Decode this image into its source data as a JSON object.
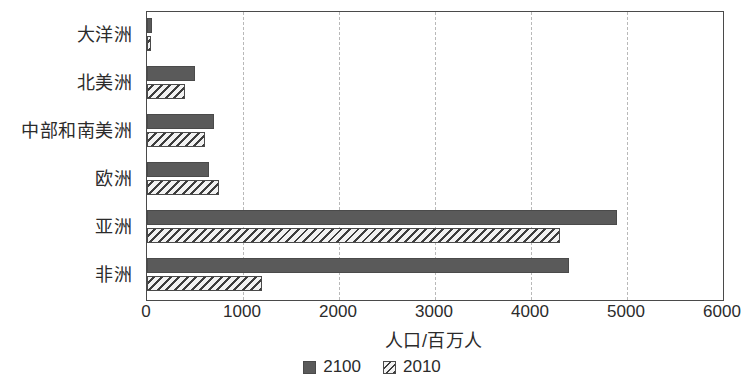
{
  "chart_data": {
    "type": "bar",
    "orientation": "horizontal",
    "title": "",
    "xlabel": "人口/百万人",
    "ylabel": "",
    "xlim": [
      0,
      6000
    ],
    "xticks": [
      0,
      1000,
      2000,
      3000,
      4000,
      5000,
      6000
    ],
    "xtick_labels": [
      "0",
      "1000",
      "2000",
      "3000",
      "4000",
      "5000",
      "6000"
    ],
    "grid": true,
    "grid_axis": "x",
    "grid_style": "dashed",
    "legend_position": "bottom-center",
    "categories": [
      "大洋洲",
      "北美洲",
      "中部和南美洲",
      "欧洲",
      "亚洲",
      "非洲"
    ],
    "series": [
      {
        "name": "2100",
        "fill": "solid",
        "color": "#5a5a5a",
        "values": [
          50,
          500,
          700,
          650,
          4900,
          4400
        ]
      },
      {
        "name": "2010",
        "fill": "hatched",
        "color": "#f2f2f2",
        "hatch_color": "#3d3d3d",
        "values": [
          40,
          400,
          600,
          750,
          4300,
          1200
        ]
      }
    ]
  },
  "legend": {
    "items": [
      {
        "label": "2100",
        "swatch": "solid-square-icon"
      },
      {
        "label": "2010",
        "swatch": "hatched-square-icon"
      }
    ]
  },
  "axis": {
    "x_title": "人口/百万人"
  }
}
